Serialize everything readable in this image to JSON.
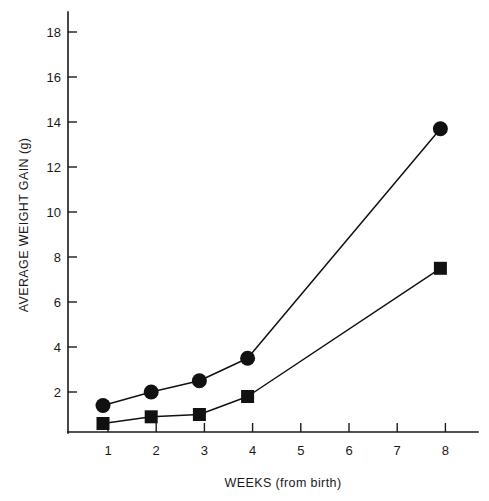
{
  "chart_data": {
    "type": "line",
    "title": "",
    "subtitle": "",
    "xlabel": "WEEKS (from birth)",
    "ylabel": "AVERAGE WEIGHT GAIN (g)",
    "categories": [
      "1",
      "2",
      "3",
      "4",
      "8"
    ],
    "x": [
      1,
      2,
      3,
      4,
      8
    ],
    "xtick_labels": [
      "1",
      "2",
      "3",
      "4",
      "5",
      "6",
      "7",
      "8"
    ],
    "xtick_values": [
      1,
      2,
      3,
      4,
      5,
      6,
      7,
      8
    ],
    "ytick_labels": [
      "2",
      "4",
      "6",
      "8",
      "10",
      "12",
      "14",
      "16",
      "18",
      "20",
      "22"
    ],
    "ytick_values": [
      2,
      4,
      6,
      8,
      10,
      12,
      14,
      16,
      18,
      20,
      22
    ],
    "xlim": [
      0.6,
      8.8
    ],
    "ylim": [
      0,
      23
    ],
    "grid": false,
    "legend": "none",
    "series": [
      {
        "name": "circle-series",
        "marker": "filled-circle",
        "color": "#111111",
        "x": [
          1,
          2,
          3,
          4,
          8
        ],
        "values": [
          1.4,
          2.0,
          2.5,
          3.5,
          13.7
        ]
      },
      {
        "name": "square-series",
        "marker": "filled-square",
        "color": "#111111",
        "x": [
          1,
          2,
          3,
          4,
          8
        ],
        "values": [
          0.6,
          0.9,
          1.0,
          1.8,
          7.5
        ]
      }
    ],
    "annotations": []
  },
  "colors": {
    "background": "#ffffff",
    "ink": "#111111",
    "axis": "#1a1a1a"
  }
}
